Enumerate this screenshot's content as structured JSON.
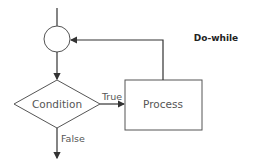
{
  "diagram": {
    "title": "Do-while",
    "nodes": {
      "junction": {
        "shape": "circle"
      },
      "condition": {
        "shape": "diamond",
        "label": "Condition"
      },
      "process": {
        "shape": "rectangle",
        "label": "Process"
      }
    },
    "edges": {
      "true_label": "True",
      "false_label": "False"
    },
    "colors": {
      "stroke": "#333333",
      "text": "#555555"
    }
  }
}
